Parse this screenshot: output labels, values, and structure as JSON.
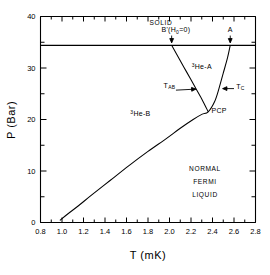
{
  "chart_data": {
    "type": "line",
    "title": "",
    "xlabel": "T (mK)",
    "ylabel": "P (Bar)",
    "xlim": [
      0.8,
      2.8
    ],
    "ylim": [
      0,
      40
    ],
    "xticks": [
      "0.8",
      "1.0",
      "1.2",
      "1.4",
      "1.6",
      "1.8",
      "2.0",
      "2.2",
      "2.4",
      "2.6",
      "2.8"
    ],
    "xtick_values": [
      0.8,
      1.0,
      1.2,
      1.4,
      1.6,
      1.8,
      2.0,
      2.2,
      2.4,
      2.6,
      2.8
    ],
    "yticks": [
      "0",
      "10",
      "20",
      "30",
      "40"
    ],
    "ytick_values": [
      0,
      10,
      20,
      30,
      40
    ],
    "grid": false,
    "legend": false,
    "melting_pressure": 34.4,
    "pcp": {
      "T": 2.36,
      "P": 21.5,
      "label": "PCP"
    },
    "series": [
      {
        "name": "Tc (normal to superfluid)",
        "comment": "superfluid transition line from 0 bar at T=0.98 up through PCP to melting curve at T=2.57",
        "points": [
          [
            0.98,
            0.4
          ],
          [
            1.05,
            1.6
          ],
          [
            1.15,
            3.2
          ],
          [
            1.28,
            5.4
          ],
          [
            1.45,
            8.2
          ],
          [
            1.62,
            11.0
          ],
          [
            1.8,
            13.8
          ],
          [
            1.97,
            16.3
          ],
          [
            2.1,
            18.3
          ],
          [
            2.22,
            20.0
          ],
          [
            2.3,
            21.0
          ],
          [
            2.36,
            21.5
          ],
          [
            2.42,
            23.5
          ],
          [
            2.46,
            26.0
          ],
          [
            2.5,
            29.0
          ],
          [
            2.54,
            32.0
          ],
          [
            2.565,
            34.4
          ]
        ]
      },
      {
        "name": "TAB (A to B transition)",
        "comment": "A-B boundary from PCP up-left to melting curve at T=2.02",
        "points": [
          [
            2.36,
            21.5
          ],
          [
            2.3,
            24.0
          ],
          [
            2.23,
            26.6
          ],
          [
            2.16,
            29.2
          ],
          [
            2.09,
            31.8
          ],
          [
            2.02,
            34.4
          ]
        ]
      }
    ],
    "annotations": [
      {
        "name": "solid-region",
        "text": "SOLID",
        "T": 1.92,
        "P": 38.3
      },
      {
        "name": "b-prime-label",
        "text": "B'(H",
        "sub": "0",
        "tail": "=0)",
        "T": 2.06,
        "P": 36.9
      },
      {
        "name": "a-label",
        "text": "A",
        "T": 2.565,
        "P": 36.9
      },
      {
        "name": "he3-a-region",
        "text": "He-A",
        "sup": "3",
        "T": 2.3,
        "P": 29.8
      },
      {
        "name": "he3-b-region",
        "text": "He-B",
        "sup": "3",
        "T": 1.73,
        "P": 20.6
      },
      {
        "name": "tab-label",
        "text": "T",
        "sub": "AB",
        "T": 2.0,
        "P": 26.2
      },
      {
        "name": "tc-label",
        "text": "T",
        "sub": "C",
        "T": 2.62,
        "P": 26.0
      },
      {
        "name": "pcp-label",
        "text": "PCP",
        "T": 2.39,
        "P": 21.3
      },
      {
        "name": "normal-fermi-liquid",
        "lines": [
          "NORMAL",
          "FERMI",
          "LIQUID"
        ],
        "T": 2.33,
        "P": 10.0
      }
    ]
  },
  "axes": {
    "x_axis_label": "T (mK)",
    "y_axis_label": "P (Bar)"
  },
  "colors": {
    "background": "#ffffff",
    "ink": "#000000"
  }
}
